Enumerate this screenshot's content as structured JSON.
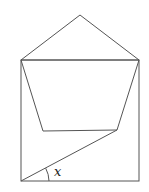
{
  "diagram": {
    "angle_label": "x",
    "colors": {
      "stroke": "#555555",
      "background": "#ffffff",
      "label": "#222222"
    }
  }
}
